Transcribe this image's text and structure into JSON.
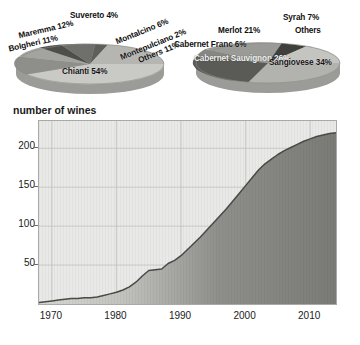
{
  "figure": {
    "title_axis": "number of wines"
  },
  "pies": [
    {
      "name": "appellation-pie",
      "slices": [
        {
          "label": "Chianti 54%",
          "name": "Chianti",
          "value": 54,
          "color": "#c9c9c5"
        },
        {
          "label": "Maremma 12%",
          "name": "Maremma",
          "value": 12,
          "color": "#8e8e8a"
        },
        {
          "label": "Bolgheri 11%",
          "name": "Bolgheri",
          "value": 11,
          "color": "#a3a39f"
        },
        {
          "label": "Others 11%",
          "name": "Others",
          "value": 11,
          "color": "#b5b5b1"
        },
        {
          "label": "Montalcino 6%",
          "name": "Montalcino",
          "value": 6,
          "color": "#6f6f6b"
        },
        {
          "label": "Suvereto 4%",
          "name": "Suvereto",
          "value": 4,
          "color": "#4d4d49"
        },
        {
          "label": "Montepulciano 2%",
          "name": "Montepulciano",
          "value": 2,
          "color": "#5e5e5a"
        }
      ]
    },
    {
      "name": "grape-variety-pie",
      "slices": [
        {
          "label": "Sangiovese 34%",
          "name": "Sangiovese",
          "value": 34,
          "color": "#b2b2ae"
        },
        {
          "label": "Cabernet Sauvignon 26%",
          "name": "Cabernet Sauvignon",
          "value": 26,
          "color": "#5a5a56"
        },
        {
          "label": "Merlot 21%",
          "name": "Merlot",
          "value": 21,
          "color": "#9a9a96"
        },
        {
          "label": "Syrah 7%",
          "name": "Syrah",
          "value": 7,
          "color": "#3f3f3b"
        },
        {
          "label": "Cabernet Franc 6%",
          "name": "Cabernet Franc",
          "value": 6,
          "color": "#868682"
        },
        {
          "label": "Others",
          "name": "Others",
          "value": 6,
          "color": "#c4c4c0"
        }
      ]
    }
  ],
  "chart_data": {
    "type": "area",
    "title": "",
    "xlabel": "",
    "ylabel": "number of wines",
    "xlim": [
      1968,
      2014
    ],
    "ylim": [
      0,
      235
    ],
    "xticks": [
      1970,
      1980,
      1990,
      2000,
      2010
    ],
    "yticks": [
      50,
      100,
      150,
      200
    ],
    "grid": true,
    "legend": "none",
    "series": [
      {
        "name": "number of wines",
        "x": [
          1968,
          1969,
          1970,
          1971,
          1972,
          1973,
          1974,
          1975,
          1976,
          1977,
          1978,
          1979,
          1980,
          1981,
          1982,
          1983,
          1984,
          1985,
          1986,
          1987,
          1988,
          1989,
          1990,
          1991,
          1992,
          1993,
          1994,
          1995,
          1996,
          1997,
          1998,
          1999,
          2000,
          2001,
          2002,
          2003,
          2004,
          2005,
          2006,
          2007,
          2008,
          2009,
          2010,
          2011,
          2012,
          2013,
          2014
        ],
        "values": [
          2,
          3,
          4,
          5,
          6,
          7,
          7,
          8,
          8,
          9,
          11,
          13,
          15,
          18,
          22,
          28,
          36,
          43,
          44,
          45,
          52,
          56,
          62,
          70,
          78,
          86,
          95,
          104,
          113,
          122,
          132,
          142,
          152,
          162,
          172,
          180,
          186,
          192,
          197,
          201,
          205,
          209,
          212,
          215,
          217,
          219,
          220
        ]
      }
    ]
  },
  "colors": {
    "plot_background": "#e9e9e7",
    "area_fill": "#7d7d79",
    "curve": "#4a4a46",
    "grid": "#c3c3bf",
    "frame": "#a9a9a6",
    "text": "#1a1a1a"
  }
}
